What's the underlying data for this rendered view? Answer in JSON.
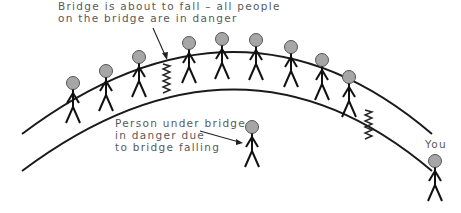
{
  "labels": {
    "bridge_line1": "Bridge is about to fall – all people",
    "bridge_line2": "on the bridge are in danger",
    "under_line1": "Person under bridge",
    "under_line2": "in danger due",
    "under_line3": "to bridge falling",
    "you": "You"
  },
  "colors": {
    "head_fill": "#a6a6a6",
    "line": "#1a1a1a",
    "text": "#5a5a5a"
  },
  "bridge_people_count": 9
}
